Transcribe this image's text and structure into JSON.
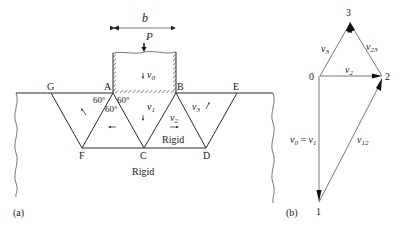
{
  "figure_a": {
    "caption": "(a)",
    "dimension_label": "b",
    "load_label": "P",
    "points": {
      "G": "G",
      "A": "A",
      "B": "B",
      "E": "E",
      "F": "F",
      "C": "C",
      "D": "D"
    },
    "angles": [
      "60°",
      "60°",
      "60°"
    ],
    "velocities": {
      "v0": "v",
      "v0_sub": "0",
      "v1": "v",
      "v1_sub": "1",
      "v2": "v",
      "v2_sub": "2",
      "v3": "v",
      "v3_sub": "3"
    },
    "rigid_labels": [
      "Rigid",
      "Rigid"
    ]
  },
  "figure_b": {
    "caption": "(b)",
    "nodes": {
      "n0": "0",
      "n1": "1",
      "n2": "2",
      "n3": "3"
    },
    "vectors": {
      "v3": {
        "base": "v",
        "sub": "3"
      },
      "v23": {
        "base": "v",
        "sub": "23"
      },
      "v2": {
        "base": "v",
        "sub": "2"
      },
      "v12": {
        "base": "v",
        "sub": "12"
      },
      "v0_eq_v1": {
        "base0": "v",
        "sub0": "0",
        "eq": " = ",
        "base1": "v",
        "sub1": "1"
      }
    }
  },
  "colors": {
    "line": "#2a2a2a",
    "background": "#ffffff"
  }
}
